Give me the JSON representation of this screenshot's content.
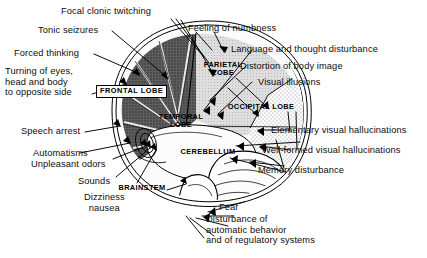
{
  "diagram": {
    "type": "anatomical-illustration",
    "view": "lateral sagittal hemisphere"
  },
  "structures": [
    {
      "id": "frontal",
      "label": "FRONTAL LOBE",
      "boxed": true,
      "shading": "dark-hatched",
      "color": "#565656"
    },
    {
      "id": "parietal",
      "label": "PARIETAL\nLOBE",
      "boxed": false,
      "shading": "light-gray",
      "color": "#d8d8d8"
    },
    {
      "id": "occipital",
      "label": "OCCIPITAL LOBE",
      "boxed": false,
      "shading": "stippled",
      "color": "#ececec"
    },
    {
      "id": "temporal",
      "label": "TEMPORAL\nLOBE",
      "boxed": false,
      "shading": "white",
      "color": "#fbfbfb"
    },
    {
      "id": "cerebellum",
      "label": "CEREBELLUM",
      "boxed": false,
      "shading": "white",
      "color": "#fbfbfb"
    },
    {
      "id": "brainstem",
      "label": "BRAINSTEM",
      "boxed": false,
      "shading": "white",
      "color": "#ffffff"
    }
  ],
  "annotations": {
    "top": [
      {
        "id": "focal-clonic-twitching",
        "text": "Focal clonic twitching"
      },
      {
        "id": "tonic-seizures",
        "text": "Tonic seizures"
      },
      {
        "id": "feeling-of-numbness",
        "text": "Feeling of numbness"
      }
    ],
    "left": [
      {
        "id": "forced-thinking",
        "text": "Forced thinking"
      },
      {
        "id": "turning-of-eyes",
        "text": "Turning of eyes,\nhead and body\nto opposite side"
      },
      {
        "id": "speech-arrest",
        "text": "Speech arrest"
      },
      {
        "id": "automatisms",
        "text": "Automatisms"
      },
      {
        "id": "unpleasant-odors",
        "text": "Unpleasant odors"
      },
      {
        "id": "sounds",
        "text": "Sounds"
      },
      {
        "id": "dizziness-nausea",
        "text": "Dizziness\nnausea"
      }
    ],
    "right": [
      {
        "id": "language-thought-disturbance",
        "text": "Language and thought disturbance"
      },
      {
        "id": "distortion-of-body-image",
        "text": "Distortion of body image"
      },
      {
        "id": "visual-illusions",
        "text": "Visual illusions"
      },
      {
        "id": "elementary-visual-hallucinations",
        "text": "Elementary visual hallucinations"
      },
      {
        "id": "well-formed-visual-hallucinations",
        "text": "Well-formed visual hallucinations"
      },
      {
        "id": "memory-disturbance",
        "text": "Memory disturbance"
      }
    ],
    "bottom": [
      {
        "id": "fear",
        "text": "Fear"
      },
      {
        "id": "autonomic-disturbance",
        "text": "Disturbance of\nautomatic behavior\nand of regulatory systems"
      }
    ]
  },
  "colors": {
    "ink": "#000000",
    "paper": "#ffffff",
    "frontal_fill": "#565656",
    "parietal_fill": "#d8d8d8",
    "occipital_fill": "#ececec",
    "temporal_fill": "#fbfbfb"
  }
}
